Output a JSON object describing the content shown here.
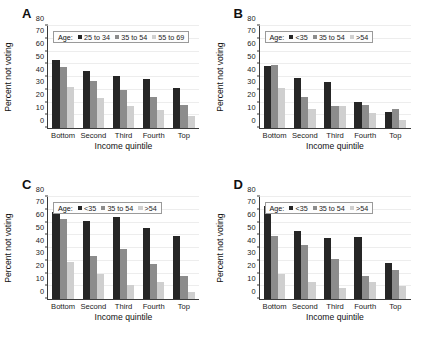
{
  "figure": {
    "panel_count": 4,
    "colors": {
      "series_0": "#262626",
      "series_1": "#8c8c8c",
      "series_2": "#cfcfcf",
      "axis": "#3a3a3a",
      "grid": "#ededed",
      "background": "#ffffff"
    },
    "legend_title": "Age:",
    "yticks": [
      0,
      10,
      20,
      30,
      40,
      50,
      60,
      70,
      80
    ]
  },
  "chart_data": [
    {
      "type": "bar",
      "panel": "A",
      "title": "",
      "xlabel": "Income quintile",
      "ylabel": "Percent not voting",
      "ylim": [
        0,
        80
      ],
      "grid": true,
      "legend_position": "top-inside",
      "legend_title": "Age:",
      "categories": [
        "Bottom",
        "Second",
        "Third",
        "Fourth",
        "Top"
      ],
      "series": [
        {
          "name": "25 to 34",
          "values": [
            53,
            45,
            40.5,
            38.5,
            31.5
          ]
        },
        {
          "name": "35 to 54",
          "values": [
            48,
            36.5,
            29.5,
            24.5,
            18
          ]
        },
        {
          "name": "55 to 69",
          "values": [
            32.5,
            23.5,
            17.5,
            14,
            9.5
          ]
        }
      ]
    },
    {
      "type": "bar",
      "panel": "B",
      "title": "",
      "xlabel": "Income quintile",
      "ylabel": "Percent not voting",
      "ylim": [
        0,
        80
      ],
      "grid": true,
      "legend_position": "top-inside",
      "legend_title": "Age:",
      "categories": [
        "Bottom",
        "Second",
        "Third",
        "Fourth",
        "Top"
      ],
      "series": [
        {
          "name": "<35",
          "values": [
            49,
            39,
            36,
            20.5,
            12.5
          ]
        },
        {
          "name": "35 to 54",
          "values": [
            49.5,
            24,
            17,
            18,
            15
          ]
        },
        {
          "name": ">54",
          "values": [
            31,
            15,
            17.5,
            12,
            6
          ]
        }
      ]
    },
    {
      "type": "bar",
      "panel": "C",
      "title": "",
      "xlabel": "Income quintile",
      "ylabel": "Percent not voting",
      "ylim": [
        0,
        80
      ],
      "grid": true,
      "legend_position": "top-inside",
      "legend_title": "Age:",
      "categories": [
        "Bottom",
        "Second",
        "Third",
        "Fourth",
        "Top"
      ],
      "series": [
        {
          "name": "<35",
          "values": [
            68,
            61,
            64,
            56,
            49.5
          ]
        },
        {
          "name": "35 to 54",
          "values": [
            63,
            34,
            39.5,
            27.5,
            18
          ]
        },
        {
          "name": ">54",
          "values": [
            29,
            20,
            11,
            13.5,
            5.5
          ]
        }
      ]
    },
    {
      "type": "bar",
      "panel": "D",
      "title": "",
      "xlabel": "Income quintile",
      "ylabel": "Percent not voting",
      "ylim": [
        0,
        80
      ],
      "grid": true,
      "legend_position": "top-inside",
      "legend_title": "Age:",
      "categories": [
        "Bottom",
        "Second",
        "Third",
        "Fourth",
        "Top"
      ],
      "series": [
        {
          "name": "<35",
          "values": [
            73,
            53.5,
            48,
            48.5,
            28.5
          ]
        },
        {
          "name": "35 to 54",
          "values": [
            49.5,
            42,
            31.5,
            18,
            22.5
          ]
        },
        {
          "name": ">54",
          "values": [
            19.5,
            13.5,
            9,
            13,
            10.5
          ]
        }
      ]
    }
  ]
}
